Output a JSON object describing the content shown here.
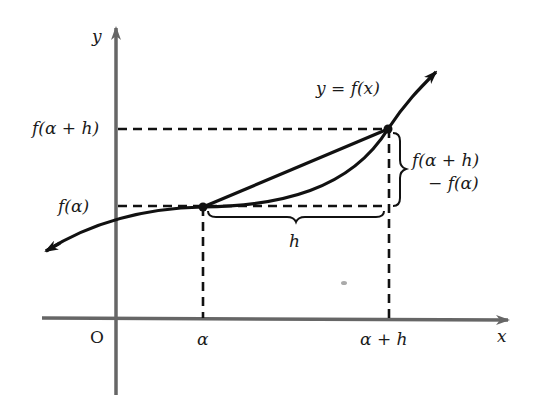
{
  "diagram": {
    "type": "function-graph-secant",
    "axes": {
      "x_label": "x",
      "y_label": "y",
      "origin_label": "O",
      "axis_color": "#666666"
    },
    "curve": {
      "label": "y = f(x)",
      "color": "#111111"
    },
    "points": [
      {
        "name": "A",
        "x_label": "α",
        "y_label": "f(α)"
      },
      {
        "name": "B",
        "x_label": "α + h",
        "y_label": "f(α + h)"
      }
    ],
    "braces": {
      "horizontal_label": "h",
      "vertical_label_line1": "f(α + h)",
      "vertical_label_line2": "− f(α)"
    }
  }
}
